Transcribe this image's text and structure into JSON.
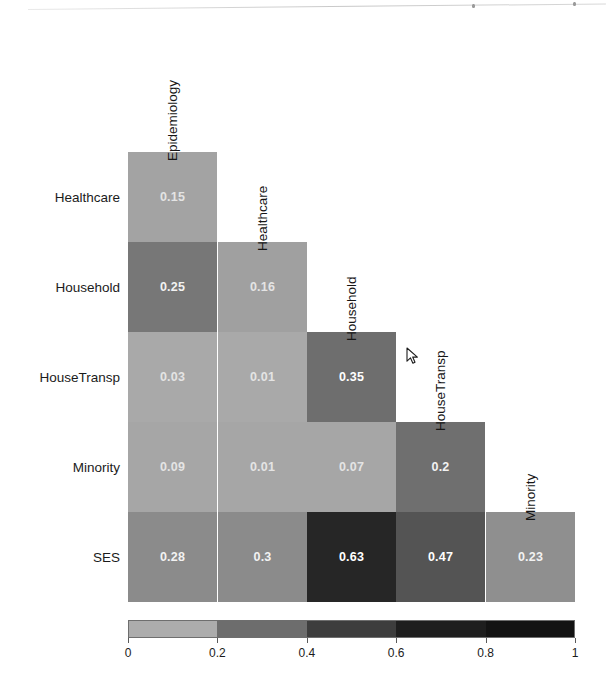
{
  "figure": {
    "type": "correlation-heatmap",
    "orientation": "lower-triangular",
    "background": "#ffffff"
  },
  "chart_data": {
    "type": "heatmap",
    "title": "",
    "subtitle": "",
    "xlabel": "",
    "ylabel": "",
    "triangular": "lower",
    "grid": false,
    "legend_position": "bottom",
    "columns": [
      "Epidemiology",
      "Healthcare",
      "Household",
      "HouseTransp",
      "Minority"
    ],
    "rows": [
      "Healthcare",
      "Household",
      "HouseTransp",
      "Minority",
      "SES"
    ],
    "values": [
      [
        0.15,
        null,
        null,
        null,
        null
      ],
      [
        0.25,
        0.16,
        null,
        null,
        null
      ],
      [
        0.03,
        0.01,
        0.35,
        null,
        null
      ],
      [
        0.09,
        0.01,
        0.07,
        0.2,
        null
      ],
      [
        0.28,
        0.3,
        0.63,
        0.47,
        0.23
      ]
    ],
    "cells": [
      {
        "row": "Healthcare",
        "col": "Epidemiology",
        "value": 0.15,
        "label": "0.15",
        "color": "#a3a3a3"
      },
      {
        "row": "Household",
        "col": "Epidemiology",
        "value": 0.25,
        "label": "0.25",
        "color": "#777777"
      },
      {
        "row": "Household",
        "col": "Healthcare",
        "value": 0.16,
        "label": "0.16",
        "color": "#a0a0a0"
      },
      {
        "row": "HouseTransp",
        "col": "Epidemiology",
        "value": 0.03,
        "label": "0.03",
        "color": "#a9a9a9"
      },
      {
        "row": "HouseTransp",
        "col": "Healthcare",
        "value": 0.01,
        "label": "0.01",
        "color": "#a9a9a9"
      },
      {
        "row": "HouseTransp",
        "col": "Household",
        "value": 0.35,
        "label": "0.35",
        "color": "#6e6e6e"
      },
      {
        "row": "Minority",
        "col": "Epidemiology",
        "value": 0.09,
        "label": "0.09",
        "color": "#a6a6a6"
      },
      {
        "row": "Minority",
        "col": "Healthcare",
        "value": 0.01,
        "label": "0.01",
        "color": "#a6a6a6"
      },
      {
        "row": "Minority",
        "col": "Household",
        "value": 0.07,
        "label": "0.07",
        "color": "#a6a6a6"
      },
      {
        "row": "Minority",
        "col": "HouseTransp",
        "value": 0.2,
        "label": "0.2",
        "color": "#6f6f6f"
      },
      {
        "row": "SES",
        "col": "Epidemiology",
        "value": 0.28,
        "label": "0.28",
        "color": "#8b8b8b"
      },
      {
        "row": "SES",
        "col": "Healthcare",
        "value": 0.3,
        "label": "0.3",
        "color": "#8b8b8b"
      },
      {
        "row": "SES",
        "col": "Household",
        "value": 0.63,
        "label": "0.63",
        "color": "#262626"
      },
      {
        "row": "SES",
        "col": "HouseTransp",
        "value": 0.47,
        "label": "0.47",
        "color": "#545454"
      },
      {
        "row": "SES",
        "col": "Minority",
        "value": 0.23,
        "label": "0.23",
        "color": "#8f8f8f"
      }
    ]
  },
  "row_labels": [
    {
      "text": "Healthcare"
    },
    {
      "text": "Household"
    },
    {
      "text": "HouseTransp"
    },
    {
      "text": "Minority"
    },
    {
      "text": "SES"
    }
  ],
  "col_labels": [
    {
      "text": "Epidemiology"
    },
    {
      "text": "Healthcare"
    },
    {
      "text": "Household"
    },
    {
      "text": "HouseTransp"
    },
    {
      "text": "Minority"
    }
  ],
  "colorbar": {
    "min": 0,
    "max": 1,
    "tick_labels": [
      "0",
      "0.2",
      "0.4",
      "0.6",
      "0.8",
      "1"
    ],
    "tick_values": [
      0,
      0.2,
      0.4,
      0.6,
      0.8,
      1
    ],
    "bands": [
      {
        "from": 0.0,
        "to": 0.2,
        "color": "#acacac"
      },
      {
        "from": 0.2,
        "to": 0.4,
        "color": "#6d6d6d"
      },
      {
        "from": 0.4,
        "to": 0.6,
        "color": "#3d3d3d"
      },
      {
        "from": 0.6,
        "to": 0.8,
        "color": "#1e1e1e"
      },
      {
        "from": 0.8,
        "to": 1.0,
        "color": "#131313"
      }
    ],
    "border_color": "#6e6e6e"
  },
  "cursor": {
    "x": 410,
    "y": 355,
    "kind": "arrow-pointer"
  }
}
